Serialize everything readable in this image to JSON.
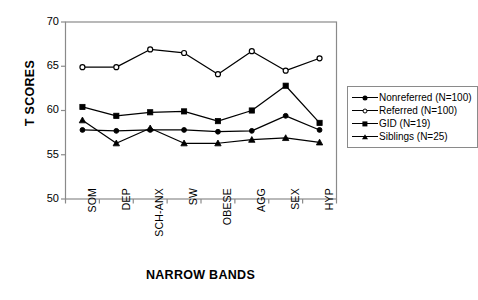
{
  "chart_data": {
    "type": "line",
    "title": "",
    "xlabel": "NARROW BANDS",
    "ylabel": "T SCORES",
    "categories": [
      "SOM",
      "DEP",
      "SCH-ANX",
      "SW",
      "OBESE",
      "AGG",
      "SEX",
      "HYP"
    ],
    "ylim": [
      50,
      70
    ],
    "yticks": [
      50,
      55,
      60,
      65,
      70
    ],
    "grid": false,
    "legend_position": "right",
    "series": [
      {
        "name": "Nonreferred (N=100)",
        "marker": "circle-filled",
        "values": [
          57.8,
          57.7,
          57.8,
          57.8,
          57.6,
          57.7,
          59.4,
          57.8
        ]
      },
      {
        "name": "Referred (N=100)",
        "marker": "circle-open",
        "values": [
          64.9,
          64.9,
          66.9,
          66.5,
          64.1,
          66.7,
          64.5,
          65.9
        ]
      },
      {
        "name": "GID (N=19)",
        "marker": "square",
        "values": [
          60.4,
          59.4,
          59.8,
          59.9,
          58.8,
          60.0,
          62.8,
          58.6
        ]
      },
      {
        "name": "Siblings (N=25)",
        "marker": "triangle",
        "values": [
          58.9,
          56.3,
          58.0,
          56.3,
          56.3,
          56.7,
          56.9,
          56.4
        ]
      }
    ]
  },
  "axes": {
    "ytick_labels": [
      "70",
      "65",
      "60",
      "55",
      "50"
    ],
    "y_title": "T SCORES",
    "x_title": "NARROW BANDS"
  },
  "legend": {
    "entries": [
      {
        "label": "Nonreferred (N=100)",
        "marker": "circle-filled"
      },
      {
        "label": "Referred (N=100)",
        "marker": "circle-open"
      },
      {
        "label": "GID (N=19)",
        "marker": "square"
      },
      {
        "label": "Siblings (N=25)",
        "marker": "triangle"
      }
    ]
  },
  "colors": {
    "line": "#000000",
    "frame": "#8a8a8a",
    "background": "#ffffff"
  }
}
